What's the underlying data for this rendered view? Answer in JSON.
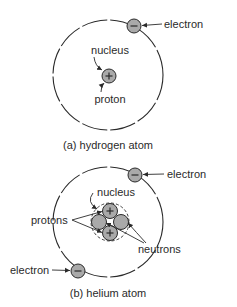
{
  "colors": {
    "background": "#ffffff",
    "ink": "#2a2a2a",
    "particle_fill": "#a9a9a9"
  },
  "hydrogen": {
    "caption": "(a) hydrogen atom",
    "labels": {
      "electron": "electron",
      "nucleus": "nucleus",
      "proton": "proton"
    },
    "particles": [
      {
        "type": "electron",
        "sign": "-"
      },
      {
        "type": "proton",
        "sign": "+"
      }
    ]
  },
  "helium": {
    "caption": "(b) helium atom",
    "labels": {
      "electron_top": "electron",
      "electron_bottom": "electron",
      "nucleus": "nucleus",
      "protons": "protons",
      "neutrons": "neutrons"
    },
    "particles": [
      {
        "type": "electron",
        "sign": "-"
      },
      {
        "type": "electron",
        "sign": "-"
      },
      {
        "type": "proton",
        "sign": "+"
      },
      {
        "type": "proton",
        "sign": "+"
      },
      {
        "type": "neutron",
        "sign": ""
      },
      {
        "type": "neutron",
        "sign": ""
      }
    ]
  }
}
